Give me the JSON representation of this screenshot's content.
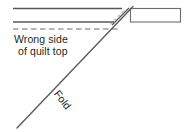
{
  "figure": {
    "type": "quilting-instruction-diagram",
    "width": 190,
    "height": 132,
    "background_color": "#ffffff",
    "stroke_color": "#58595b",
    "dash_color": "#6d6e71",
    "text_color": "#231f20"
  },
  "labels": {
    "wrong_side_line1": "Wrong side",
    "wrong_side_line2": "of quilt top",
    "fold": "Fold"
  },
  "geometry": {
    "top_edge_line": {
      "x1": 13,
      "y1": 8,
      "x2": 121,
      "y2": 8
    },
    "lower_edge_line": {
      "x1": 13,
      "y1": 22,
      "x2": 113,
      "y2": 22
    },
    "dashed_seam_line": {
      "x1": 13,
      "y1": 29,
      "x2": 117,
      "y2": 29
    },
    "fold_diagonal": {
      "x1": 17,
      "y1": 128,
      "x2": 132,
      "y2": 7
    },
    "short_diagonal": {
      "x1": 113,
      "y1": 24,
      "x2": 128,
      "y2": 8
    },
    "dashed_diagonal": {
      "x1": 110,
      "y1": 26,
      "x2": 124,
      "y2": 11
    },
    "binding_strip_rect": {
      "x": 130,
      "y": 8,
      "width": 51,
      "height": 14
    }
  }
}
